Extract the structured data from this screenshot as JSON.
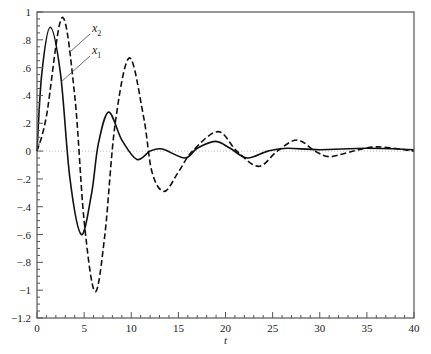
{
  "chart_data": {
    "type": "line",
    "title": "",
    "xlabel": "t",
    "ylabel": "",
    "xlim": [
      0,
      40
    ],
    "ylim": [
      -1.2,
      1
    ],
    "grid": false,
    "legend_position": "inline annotations with arrows near top-left",
    "x_ticks": [
      0,
      5,
      10,
      15,
      20,
      25,
      30,
      35,
      40
    ],
    "x_tick_labels": [
      "0",
      "5",
      "10",
      "15",
      "20",
      "25",
      "30",
      "35",
      "40"
    ],
    "y_ticks": [
      1,
      0.8,
      0.6,
      0.4,
      0.2,
      0,
      -0.2,
      -0.4,
      -0.6,
      -0.8,
      -1,
      -1.2
    ],
    "y_tick_labels": [
      "1",
      ".8",
      ".6",
      ".4",
      ".2",
      "0",
      "−.2",
      "−.4",
      "−.6",
      "−.8",
      "−1",
      "−1.2"
    ],
    "zero_reference_line": {
      "y": 0,
      "style": "dotted",
      "color": "#bbbbbb"
    },
    "series": [
      {
        "name": "x1",
        "label_main": "x",
        "label_sub": "1",
        "style": "solid",
        "color": "#111111",
        "points": [
          [
            0,
            0
          ],
          [
            0.5,
            0.55
          ],
          [
            1.4,
            0.89
          ],
          [
            2.5,
            0.55
          ],
          [
            3.5,
            -0.2
          ],
          [
            4.7,
            -0.6
          ],
          [
            5.8,
            -0.3
          ],
          [
            6.5,
            0.05
          ],
          [
            7.6,
            0.28
          ],
          [
            9,
            0.08
          ],
          [
            10.6,
            -0.06
          ],
          [
            12,
            0.0
          ],
          [
            13.3,
            0.015
          ],
          [
            15.7,
            -0.05
          ],
          [
            17,
            0.02
          ],
          [
            18.9,
            0.07
          ],
          [
            20.5,
            0.02
          ],
          [
            22.3,
            -0.05
          ],
          [
            24.5,
            0.0
          ],
          [
            26.5,
            0.02
          ],
          [
            30,
            0.01
          ],
          [
            35,
            0.02
          ],
          [
            40,
            0.01
          ]
        ]
      },
      {
        "name": "x2",
        "label_main": "x",
        "label_sub": "2",
        "style": "dashed",
        "color": "#111111",
        "points": [
          [
            0,
            0
          ],
          [
            1,
            0.25
          ],
          [
            2.65,
            0.96
          ],
          [
            4,
            0.4
          ],
          [
            5,
            -0.5
          ],
          [
            6.15,
            -1.01
          ],
          [
            7.2,
            -0.6
          ],
          [
            8.3,
            0.2
          ],
          [
            9.8,
            0.67
          ],
          [
            11.3,
            0.25
          ],
          [
            12.2,
            -0.15
          ],
          [
            13.5,
            -0.29
          ],
          [
            15,
            -0.15
          ],
          [
            16.5,
            0.0
          ],
          [
            19.2,
            0.14
          ],
          [
            21.2,
            0.0
          ],
          [
            23.5,
            -0.11
          ],
          [
            25.5,
            0.0
          ],
          [
            27.6,
            0.08
          ],
          [
            29.5,
            0.0
          ],
          [
            31,
            -0.04
          ],
          [
            33,
            -0.01
          ],
          [
            36,
            0.03
          ],
          [
            40,
            0.0
          ]
        ]
      }
    ],
    "annotations": [
      {
        "text": "x2",
        "arrow_to_series": "x2"
      },
      {
        "text": "x1",
        "arrow_to_series": "x1"
      }
    ]
  }
}
